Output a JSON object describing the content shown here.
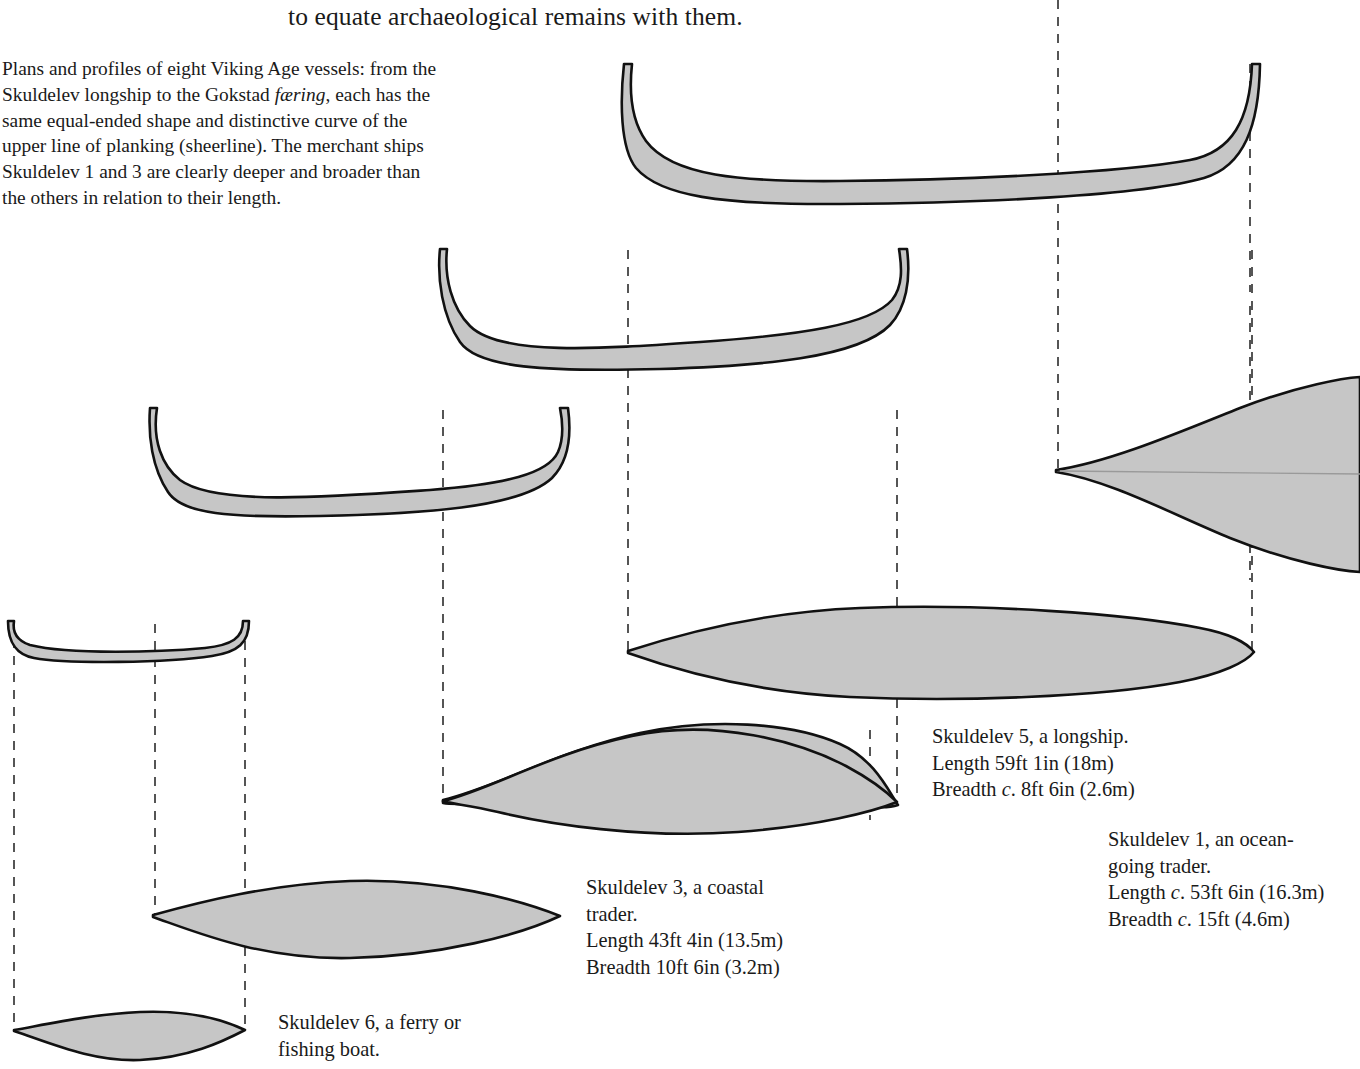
{
  "document": {
    "running_head_clipped": "people, and it is a long step, therefore,",
    "running_head": "to equate archaeological remains with them."
  },
  "caption": {
    "line1": "Plans and profiles of eight Viking Age vessels: from the",
    "line2a": "Skuldelev longship to the Gokstad ",
    "line2_italic": "færing",
    "line2b": ", each has the",
    "line3": "same equal-ended shape and distinctive curve of the",
    "line4": "upper line of planking (sheerline). The merchant ships",
    "line5": "Skuldelev 1 and 3 are clearly deeper and broader than",
    "line6": "the others in relation to their length."
  },
  "labels": {
    "skuldelev5": {
      "name": "Skuldelev 5, a longship.",
      "length": "Length 59ft 1in (18m)",
      "breadth_prefix": "Breadth ",
      "breadth_c": "c",
      "breadth_rest": ". 8ft 6in (2.6m)"
    },
    "skuldelev1": {
      "name_line1": "Skuldelev 1, an ocean-",
      "name_line2": "going trader.",
      "length_prefix": "Length ",
      "length_c": "c",
      "length_rest": ". 53ft 6in (16.3m)",
      "breadth_prefix": "Breadth ",
      "breadth_c": "c",
      "breadth_rest": ". 15ft (4.6m)"
    },
    "skuldelev3": {
      "name_line1": "Skuldelev 3, a coastal",
      "name_line2": "trader.",
      "length": "Length 43ft 4in (13.5m)",
      "breadth": "Breadth 10ft 6in (3.2m)"
    },
    "skuldelev6": {
      "name_line1": "Skuldelev 6, a ferry or",
      "name_line2": "fishing boat."
    }
  },
  "figure": {
    "fill_color": "#c6c6c6",
    "stroke_color": "#111111",
    "dash_color": "#555555",
    "background": "#ffffff",
    "vessels": [
      {
        "id": "skuldelev1",
        "view": "profile",
        "position": "top",
        "note": "large ocean-going trader hull profile, upswept ends"
      },
      {
        "id": "skuldelev5",
        "view": "profile",
        "position": "second",
        "note": "longship hull profile"
      },
      {
        "id": "skuldelev3",
        "view": "profile",
        "position": "third",
        "note": "coastal trader hull profile"
      },
      {
        "id": "skuldelev6",
        "view": "profile",
        "position": "fourth",
        "note": "small ferry / fishing boat profile"
      },
      {
        "id": "skuldelev1",
        "view": "plan",
        "position": "right",
        "note": "broad lens plan, clipped at right edge"
      },
      {
        "id": "skuldelev5",
        "view": "plan",
        "position": "middle",
        "note": "narrow long lens plan"
      },
      {
        "id": "skuldelev3",
        "view": "plan",
        "position": "lower",
        "note": "broad lens plan"
      },
      {
        "id": "skuldelev6",
        "view": "plan",
        "position": "bottom",
        "note": "small lens plan"
      }
    ]
  }
}
